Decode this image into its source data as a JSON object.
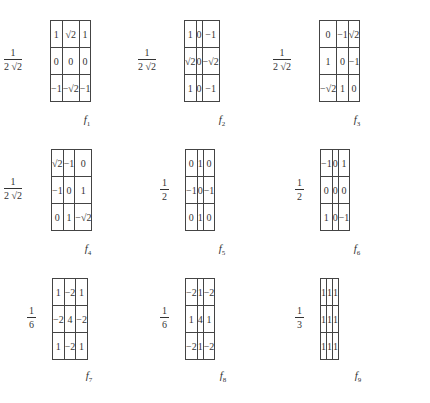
{
  "filters": [
    {
      "name": "f",
      "index": "1",
      "coef_num": "1",
      "coef_den": "2 √2",
      "cells": [
        [
          "1",
          "√2",
          "1"
        ],
        [
          "0",
          "0",
          "0"
        ],
        [
          "−1",
          "−√2",
          "−1"
        ]
      ]
    },
    {
      "name": "f",
      "index": "2",
      "coef_num": "1",
      "coef_den": "2 √2",
      "cells": [
        [
          "1",
          "0",
          "−1"
        ],
        [
          "√2",
          "0",
          "−√2"
        ],
        [
          "1",
          "0",
          "−1"
        ]
      ]
    },
    {
      "name": "f",
      "index": "3",
      "coef_num": "1",
      "coef_den": "2 √2",
      "cells": [
        [
          "0",
          "−1",
          "√2"
        ],
        [
          "1",
          "0",
          "−1"
        ],
        [
          "−√2",
          "1",
          "0"
        ]
      ]
    },
    {
      "name": "f",
      "index": "4",
      "coef_num": "1",
      "coef_den": "2 √2",
      "cells": [
        [
          "√2",
          "−1",
          "0"
        ],
        [
          "−1",
          "0",
          "1"
        ],
        [
          "0",
          "1",
          "−√2"
        ]
      ]
    },
    {
      "name": "f",
      "index": "5",
      "coef_num": "1",
      "coef_den": "2",
      "cells": [
        [
          "0",
          "1",
          "0"
        ],
        [
          "−1",
          "0",
          "−1"
        ],
        [
          "0",
          "1",
          "0"
        ]
      ]
    },
    {
      "name": "f",
      "index": "6",
      "coef_num": "1",
      "coef_den": "2",
      "cells": [
        [
          "−1",
          "0",
          "1"
        ],
        [
          "0",
          "0",
          "0"
        ],
        [
          "1",
          "0",
          "−1"
        ]
      ]
    },
    {
      "name": "f",
      "index": "7",
      "coef_num": "1",
      "coef_den": "6",
      "cells": [
        [
          "1",
          "−2",
          "1"
        ],
        [
          "−2",
          "4",
          "−2"
        ],
        [
          "1",
          "−2",
          "1"
        ]
      ]
    },
    {
      "name": "f",
      "index": "8",
      "coef_num": "1",
      "coef_den": "6",
      "cells": [
        [
          "−2",
          "1",
          "−2"
        ],
        [
          "1",
          "4",
          "1"
        ],
        [
          "−2",
          "1",
          "−2"
        ]
      ]
    },
    {
      "name": "f",
      "index": "9",
      "coef_num": "1",
      "coef_den": "3",
      "cells": [
        [
          "1",
          "1",
          "1"
        ],
        [
          "1",
          "1",
          "1"
        ],
        [
          "1",
          "1",
          "1"
        ]
      ]
    }
  ]
}
